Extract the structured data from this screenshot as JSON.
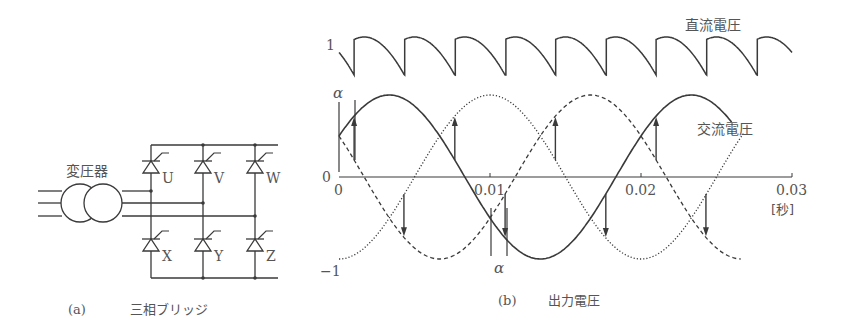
{
  "colors": {
    "ink": "#3a3a3a",
    "text": "#555555"
  },
  "panel_a": {
    "transformer_label": "変圧器",
    "thyristors_top": [
      "U",
      "V",
      "W"
    ],
    "thyristors_bottom": [
      "X",
      "Y",
      "Z"
    ],
    "caption_tag": "(a)",
    "caption": "三相ブリッジ"
  },
  "panel_b": {
    "dc_label": "直流電圧",
    "ac_label": "交流電圧",
    "y_top_label": "1",
    "y_zero_label": "0",
    "y_neg_label": "−1",
    "alpha_label": "α",
    "x_unit": "[秒]",
    "caption_tag": "(b)",
    "caption": "出力電圧"
  },
  "chart_data": {
    "type": "line",
    "title": "出力電圧",
    "xlabel": "[秒]",
    "ylabel": "",
    "xlim": [
      0,
      0.03
    ],
    "ylim": [
      -1,
      1
    ],
    "x_ticks": [
      "0",
      "0.01",
      "0.02",
      "0.03"
    ],
    "x_tick_values": [
      0,
      0.01,
      0.02,
      0.03
    ],
    "frequency_hz": 50,
    "firing_angle_deg": 18,
    "ac_series": [
      {
        "name": "U相",
        "style": "solid",
        "phase_deg": 30,
        "t_end": 0.026
      },
      {
        "name": "V相",
        "style": "dotted",
        "phase_deg": -90,
        "t_end": 0.0268
      },
      {
        "name": "W相",
        "style": "dashed",
        "phase_deg": 150,
        "t_end": 0.0266
      }
    ],
    "dc_series": {
      "name": "直流電圧",
      "pulses": 6,
      "peak": 1,
      "t_end": 0.03
    },
    "fire_up_times": [
      0.001,
      0.00767,
      0.01433,
      0.021
    ],
    "fire_down_times": [
      0.0043,
      0.011,
      0.01767,
      0.0243
    ]
  }
}
